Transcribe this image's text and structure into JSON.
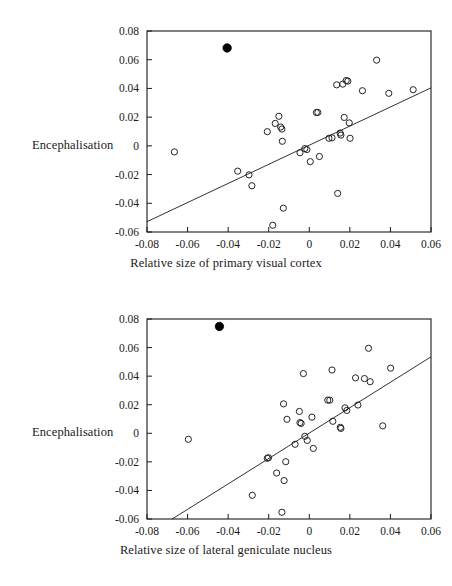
{
  "figure": {
    "title": "",
    "background": "#ffffff",
    "ink": "#1a1a1a"
  },
  "chart_data": [
    {
      "id": "primary-visual-cortex",
      "type": "scatter",
      "title": "",
      "xlabel": "Relative size of primary visual cortex",
      "ylabel": "Encephalisation",
      "xlim": [
        -0.08,
        0.06
      ],
      "ylim": [
        -0.06,
        0.08
      ],
      "xticks": [
        -0.08,
        -0.06,
        -0.04,
        -0.02,
        0,
        0.02,
        0.04,
        0.06
      ],
      "yticks": [
        -0.06,
        -0.04,
        -0.02,
        0,
        0.02,
        0.04,
        0.06,
        0.08
      ],
      "xticklabels": [
        "-0.08",
        "-0.06",
        "-0.04",
        "-0.02",
        "0",
        "0.02",
        "0.04",
        "0.06"
      ],
      "yticklabels": [
        "-0.06",
        "-0.04",
        "-0.02",
        "0",
        "0.02",
        "0.04",
        "0.06",
        "0.08"
      ],
      "grid": false,
      "legend": null,
      "series": [
        {
          "name": "open-points",
          "marker": "open-circle",
          "color": "#1a1a1a",
          "points": [
            [
              -0.0665,
              -0.0042
            ],
            [
              -0.0353,
              -0.0176
            ],
            [
              -0.0297,
              -0.0202
            ],
            [
              -0.0283,
              -0.0278
            ],
            [
              -0.0207,
              0.0099
            ],
            [
              -0.018,
              -0.0553
            ],
            [
              -0.0168,
              0.0156
            ],
            [
              -0.015,
              0.0206
            ],
            [
              -0.0141,
              0.0131
            ],
            [
              -0.0135,
              0.0117
            ],
            [
              -0.0133,
              0.0032
            ],
            [
              -0.0128,
              -0.0434
            ],
            [
              -0.0046,
              -0.0048
            ],
            [
              -0.0022,
              -0.0019
            ],
            [
              -0.0012,
              -0.0026
            ],
            [
              0.0005,
              -0.011
            ],
            [
              0.0035,
              0.0232
            ],
            [
              0.0042,
              0.0233
            ],
            [
              0.005,
              -0.0074
            ],
            [
              0.0097,
              0.0053
            ],
            [
              0.0112,
              0.0056
            ],
            [
              0.0135,
              0.0425
            ],
            [
              0.014,
              -0.0331
            ],
            [
              0.0152,
              0.0089
            ],
            [
              0.0156,
              0.0075
            ],
            [
              0.0165,
              0.043
            ],
            [
              0.0172,
              0.0198
            ],
            [
              0.0182,
              0.0455
            ],
            [
              0.019,
              0.0451
            ],
            [
              0.0197,
              0.016
            ],
            [
              0.0201,
              0.0053
            ],
            [
              0.0262,
              0.0384
            ],
            [
              0.0332,
              0.0597
            ],
            [
              0.0392,
              0.0366
            ],
            [
              0.0512,
              0.0391
            ]
          ]
        },
        {
          "name": "filled-point",
          "marker": "filled-circle",
          "color": "#000000",
          "points": [
            [
              -0.0405,
              0.0682
            ]
          ]
        }
      ],
      "trendline": {
        "x0": -0.08,
        "y0": -0.0528,
        "x1": 0.06,
        "y1": 0.0404
      }
    },
    {
      "id": "lateral-geniculate-nucleus",
      "type": "scatter",
      "title": "",
      "xlabel": "Relative size of lateral geniculate nucleus",
      "ylabel": "Encephalisation",
      "xlim": [
        -0.08,
        0.06
      ],
      "ylim": [
        -0.06,
        0.08
      ],
      "xticks": [
        -0.08,
        -0.06,
        -0.04,
        -0.02,
        0,
        0.02,
        0.04,
        0.06
      ],
      "yticks": [
        -0.06,
        -0.04,
        -0.02,
        0,
        0.02,
        0.04,
        0.06,
        0.08
      ],
      "xticklabels": [
        "-0.08",
        "-0.06",
        "-0.04",
        "-0.02",
        "0",
        "0.02",
        "0.04",
        "0.06"
      ],
      "yticklabels": [
        "-0.06",
        "-0.04",
        "-0.02",
        "0",
        "0.02",
        "0.04",
        "0.06",
        "0.08"
      ],
      "grid": false,
      "legend": null,
      "series": [
        {
          "name": "open-points",
          "marker": "open-circle",
          "color": "#1a1a1a",
          "points": [
            [
              -0.0596,
              -0.0042
            ],
            [
              -0.0281,
              -0.0434
            ],
            [
              -0.0207,
              -0.0175
            ],
            [
              -0.0201,
              -0.0171
            ],
            [
              -0.0161,
              -0.0278
            ],
            [
              -0.0135,
              -0.0553
            ],
            [
              -0.0127,
              0.0206
            ],
            [
              -0.0124,
              -0.0331
            ],
            [
              -0.0116,
              -0.0199
            ],
            [
              -0.011,
              0.0098
            ],
            [
              -0.007,
              -0.0077
            ],
            [
              -0.0049,
              0.0153
            ],
            [
              -0.0046,
              0.0075
            ],
            [
              -0.004,
              0.0069
            ],
            [
              -0.0029,
              0.0418
            ],
            [
              -0.0022,
              -0.0021
            ],
            [
              -0.001,
              -0.005
            ],
            [
              0.0013,
              0.0113
            ],
            [
              0.002,
              -0.0106
            ],
            [
              0.0091,
              0.0232
            ],
            [
              0.0101,
              0.0232
            ],
            [
              0.0112,
              0.0443
            ],
            [
              0.0116,
              0.0084
            ],
            [
              0.0153,
              0.0042
            ],
            [
              0.0156,
              0.0034
            ],
            [
              0.0176,
              0.0178
            ],
            [
              0.0185,
              0.016
            ],
            [
              0.0228,
              0.0388
            ],
            [
              0.024,
              0.0198
            ],
            [
              0.0272,
              0.0383
            ],
            [
              0.0292,
              0.0595
            ],
            [
              0.03,
              0.0361
            ],
            [
              0.0362,
              0.0052
            ],
            [
              0.0401,
              0.0456
            ]
          ]
        },
        {
          "name": "filled-point",
          "marker": "filled-circle",
          "color": "#000000",
          "points": [
            [
              -0.0443,
              0.0748
            ]
          ]
        }
      ],
      "trendline": {
        "x0": -0.0676,
        "y0": -0.06,
        "x1": 0.06,
        "y1": 0.0535
      }
    }
  ]
}
